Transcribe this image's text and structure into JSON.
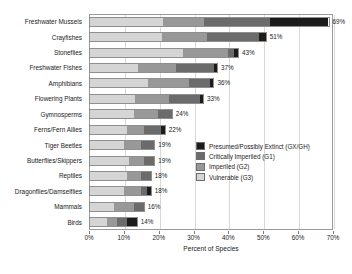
{
  "chart_data": {
    "type": "bar",
    "orientation": "horizontal",
    "stacked": true,
    "title": "",
    "xlabel": "Percent of Species",
    "ylabel": "",
    "xlim": [
      0,
      70
    ],
    "xticks": [
      "0%",
      "10%",
      "20%",
      "30%",
      "40%",
      "50%",
      "60%",
      "70%"
    ],
    "xtick_values": [
      0,
      10,
      20,
      30,
      40,
      50,
      60,
      70
    ],
    "grid": true,
    "legend_position": "inside-right",
    "categories": [
      "Freshwater Mussels",
      "Crayfishes",
      "Stoneflies",
      "Freshwater Fishes",
      "Amphibians",
      "Flowering Plants",
      "Gymnosperms",
      "Ferns/Fern Allies",
      "Tiger Beetles",
      "Butterflies/Skippers",
      "Reptiles",
      "Dragonflies/Damselflies",
      "Mammals",
      "Birds"
    ],
    "series": [
      {
        "name": "Vulnerable (G3)",
        "color": "#d5d5d5",
        "values": [
          21,
          21,
          27,
          14,
          17,
          13,
          13,
          11,
          10,
          11,
          11,
          10,
          7,
          5
        ]
      },
      {
        "name": "Imperiled (G2)",
        "color": "#989898",
        "values": [
          12,
          13,
          13,
          11,
          12,
          10,
          7,
          5,
          5,
          4,
          4,
          5,
          6,
          3
        ]
      },
      {
        "name": "Critically Imperiled (G1)",
        "color": "#6b6b6b",
        "values": [
          19,
          15,
          2,
          11,
          6,
          9,
          4,
          5,
          4,
          3,
          3,
          2,
          3,
          3
        ]
      },
      {
        "name": "Presumed/Possibly Extinct (GX/GH)",
        "color": "#1c1c1c",
        "values": [
          17,
          2,
          1,
          1,
          1,
          1,
          0,
          1,
          0,
          0,
          0,
          1,
          0,
          3
        ]
      }
    ],
    "totals": [
      69,
      51,
      43,
      37,
      36,
      33,
      24,
      22,
      19,
      19,
      18,
      18,
      16,
      14
    ],
    "total_labels": [
      "69%",
      "51%",
      "43%",
      "37%",
      "36%",
      "33%",
      "24%",
      "22%",
      "19%",
      "19%",
      "18%",
      "18%",
      "16%",
      "14%"
    ]
  },
  "legend": {
    "items": [
      {
        "label": "Presumed/Possibly Extinct (GX/GH)",
        "color": "#1c1c1c"
      },
      {
        "label": "Critically Imperiled (G1)",
        "color": "#6b6b6b"
      },
      {
        "label": "Imperiled (G2)",
        "color": "#989898"
      },
      {
        "label": "Vulnerable (G3)",
        "color": "#d5d5d5"
      }
    ]
  }
}
